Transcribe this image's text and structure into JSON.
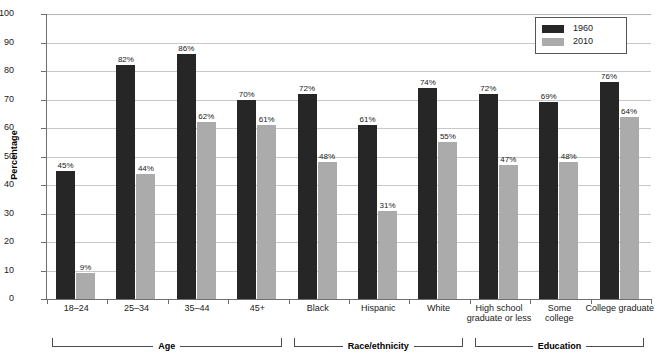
{
  "chart_data": {
    "type": "bar",
    "title": "",
    "xlabel": "",
    "ylabel": "Percentage",
    "ylim": [
      0,
      100
    ],
    "ytick_step": 10,
    "grid": true,
    "legend_position": "top-right",
    "categories": [
      "18–24",
      "25–34",
      "35–44",
      "45+",
      "Black",
      "Hispanic",
      "White",
      "High school\ngraduate or less",
      "Some\ncollege",
      "College graduate"
    ],
    "yticks": [
      "0",
      "10",
      "20",
      "30",
      "40",
      "50",
      "60",
      "70",
      "80",
      "90",
      "100"
    ],
    "series": [
      {
        "name": "1960",
        "color": "#262626",
        "values": [
          45,
          82,
          86,
          70,
          72,
          61,
          74,
          72,
          69,
          76
        ],
        "labels": [
          "45%",
          "82%",
          "86%",
          "70%",
          "72%",
          "61%",
          "74%",
          "72%",
          "69%",
          "76%"
        ]
      },
      {
        "name": "2010",
        "color": "#ababab",
        "values": [
          9,
          44,
          62,
          61,
          48,
          31,
          55,
          47,
          48,
          64
        ],
        "labels": [
          "9%",
          "44%",
          "62%",
          "61%",
          "48%",
          "31%",
          "55%",
          "47%",
          "48%",
          "64%"
        ]
      }
    ],
    "category_labels": [
      {
        "line1": "18–24",
        "line2": ""
      },
      {
        "line1": "25–34",
        "line2": ""
      },
      {
        "line1": "35–44",
        "line2": ""
      },
      {
        "line1": "45+",
        "line2": ""
      },
      {
        "line1": "Black",
        "line2": ""
      },
      {
        "line1": "Hispanic",
        "line2": ""
      },
      {
        "line1": "White",
        "line2": ""
      },
      {
        "line1": "High school",
        "line2": "graduate or less"
      },
      {
        "line1": "Some",
        "line2": "college"
      },
      {
        "line1": "College graduate",
        "line2": ""
      }
    ],
    "groups": [
      {
        "label": "Age",
        "first": 0,
        "last": 3
      },
      {
        "label": "Race/ethnicity",
        "first": 4,
        "last": 6
      },
      {
        "label": "Education",
        "first": 7,
        "last": 9
      }
    ]
  },
  "legend": {
    "items": [
      {
        "label": "1960",
        "color": "#262626"
      },
      {
        "label": "2010",
        "color": "#ababab"
      }
    ]
  },
  "axis": {
    "y_title": "Percentage"
  }
}
